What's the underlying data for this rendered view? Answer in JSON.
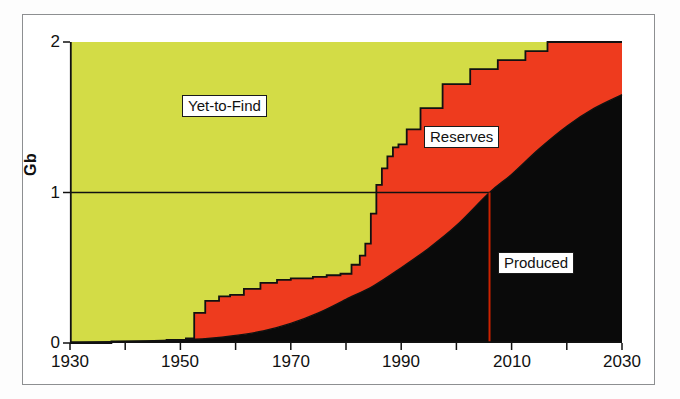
{
  "figure": {
    "background_color": "#ffffff",
    "frame_color": "#8d8f91"
  },
  "chart_data": {
    "type": "area",
    "stacked": true,
    "title": "",
    "subtitle": "",
    "xlabel": "",
    "ylabel": "Gb",
    "xlim": [
      1930,
      2030
    ],
    "ylim": [
      0,
      2
    ],
    "x_tick_labels": [
      "1930",
      "1950",
      "1970",
      "1990",
      "2010",
      "2030"
    ],
    "x_tick_values": [
      1930,
      1950,
      1970,
      1990,
      2010,
      2030
    ],
    "x_minor_tick_interval": 10,
    "y_tick_labels": [
      "0",
      "1",
      "2"
    ],
    "y_tick_values": [
      0,
      1,
      2
    ],
    "grid": false,
    "legend": "inline-labels",
    "colors": {
      "produced": "#0a0a0a",
      "reserves": "#ee3b1e",
      "yet_to_find": "#d3dc46",
      "marker_line": "#cc2200",
      "outline": "#111111"
    },
    "annotations": [
      {
        "name": "yet-to-find-label",
        "text": "Yet-to-Find",
        "x": 1963,
        "y": 1.68
      },
      {
        "name": "reserves-label",
        "text": "Reserves",
        "x": 1996,
        "y": 1.48
      },
      {
        "name": "produced-label",
        "text": "Produced",
        "x": 2017,
        "y": 0.6
      }
    ],
    "reference_lines": [
      {
        "name": "half-depletion-horizontal",
        "orientation": "horizontal",
        "value": 1.0,
        "from_x": 1930,
        "to_x": 2006
      },
      {
        "name": "peak-year-vertical",
        "orientation": "vertical",
        "value": 2006,
        "from_y": 0,
        "to_y": 1.0,
        "color": "#cc2200"
      }
    ],
    "series": [
      {
        "name": "Produced",
        "color": "#0a0a0a",
        "x": [
          1930,
          1940,
          1950,
          1955,
          1960,
          1965,
          1970,
          1975,
          1980,
          1985,
          1990,
          1995,
          2000,
          2006,
          2010,
          2015,
          2020,
          2025,
          2030
        ],
        "values": [
          0.0,
          0.01,
          0.02,
          0.03,
          0.05,
          0.08,
          0.13,
          0.2,
          0.29,
          0.38,
          0.5,
          0.63,
          0.78,
          1.0,
          1.12,
          1.29,
          1.44,
          1.56,
          1.65
        ]
      },
      {
        "name": "Reserves",
        "color": "#ee3b1e",
        "x": [
          1930,
          1940,
          1950,
          1952,
          1954,
          1956,
          1958,
          1960,
          1965,
          1970,
          1972,
          1975,
          1980,
          1983,
          1985,
          1986,
          1988,
          1990,
          1995,
          2000,
          2006,
          2010,
          2015,
          2020,
          2025,
          2030
        ],
        "values": [
          0.0,
          0.01,
          0.02,
          0.03,
          0.16,
          0.24,
          0.26,
          0.27,
          0.29,
          0.3,
          0.3,
          0.28,
          0.3,
          0.36,
          0.43,
          0.62,
          0.78,
          0.82,
          0.86,
          0.82,
          0.7,
          0.63,
          0.53,
          0.44,
          0.43,
          0.35
        ]
      },
      {
        "name": "Yet-to-Find",
        "color": "#d3dc46",
        "x": [
          1930,
          1950,
          1955,
          1960,
          1970,
          1980,
          1985,
          1990,
          1995,
          2000,
          2006,
          2010,
          2015,
          2018,
          2020,
          2030
        ],
        "values": [
          2.0,
          1.98,
          1.72,
          1.68,
          1.57,
          1.32,
          1.14,
          0.68,
          0.44,
          0.28,
          0.16,
          0.12,
          0.06,
          0.0,
          0.0,
          0.0
        ]
      }
    ],
    "cumulative_discovery_curve": {
      "name": "Total discovered (Produced + Reserves)",
      "x": [
        1930,
        1945,
        1950,
        1952,
        1953,
        1956,
        1958,
        1960,
        1963,
        1966,
        1969,
        1971,
        1973,
        1975,
        1978,
        1980,
        1982,
        1983,
        1984,
        1985,
        1986,
        1987,
        1988,
        1989,
        1990,
        1992,
        1995,
        2000,
        2005,
        2010,
        2015,
        2018,
        2020,
        2025,
        2030
      ],
      "values": [
        0.0,
        0.01,
        0.02,
        0.03,
        0.2,
        0.28,
        0.31,
        0.32,
        0.36,
        0.4,
        0.42,
        0.43,
        0.43,
        0.44,
        0.45,
        0.46,
        0.52,
        0.58,
        0.66,
        0.86,
        1.05,
        1.16,
        1.24,
        1.3,
        1.32,
        1.42,
        1.56,
        1.72,
        1.82,
        1.88,
        1.94,
        2.0,
        2.0,
        2.0,
        2.0
      ]
    }
  },
  "axis": {
    "y_label": "Gb",
    "y_ticks": [
      "2",
      "1",
      "0"
    ],
    "x_ticks": [
      "1930",
      "1950",
      "1970",
      "1990",
      "2010",
      "2030"
    ]
  },
  "labels": {
    "yet_to_find": "Yet-to-Find",
    "reserves": "Reserves",
    "produced": "Produced"
  }
}
